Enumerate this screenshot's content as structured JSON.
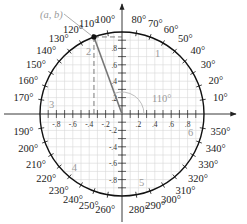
{
  "diagram": {
    "point_label": "(a, b)",
    "angle_label": "110°",
    "angle_deg": 110,
    "center": {
      "x": 122,
      "y": 114
    },
    "radius": 82,
    "grid_step": 0.1,
    "colors": {
      "circle": "#111111",
      "grid": "#d6d6d6",
      "axis": "#222222",
      "ray": "#777777",
      "annotation": "#999999"
    },
    "x_ticks": [
      "-.8",
      "-.6",
      "-.4",
      "-.2",
      ".2",
      ".4",
      ".6",
      ".8"
    ],
    "y_ticks": [
      ".8",
      ".6",
      ".4",
      ".2",
      "-.2",
      "-.4",
      "-.6",
      "-.8"
    ],
    "degree_labels": [
      "10°",
      "20°",
      "30°",
      "40°",
      "50°",
      "60°",
      "70°",
      "80°",
      "100°",
      "110°",
      "120°",
      "130°",
      "140°",
      "150°",
      "160°",
      "170°",
      "190°",
      "200°",
      "210°",
      "220°",
      "230°",
      "240°",
      "250°",
      "260°",
      "280°",
      "290°",
      "300°",
      "310°",
      "320°",
      "330°",
      "340°",
      "350°"
    ],
    "markers": [
      {
        "label": "1",
        "angle": 60
      },
      {
        "label": "2",
        "angle": 118
      },
      {
        "label": "3",
        "angle": 172
      },
      {
        "label": "4",
        "angle": 228
      },
      {
        "label": "5",
        "angle": 286
      },
      {
        "label": "6",
        "angle": 345
      }
    ]
  }
}
